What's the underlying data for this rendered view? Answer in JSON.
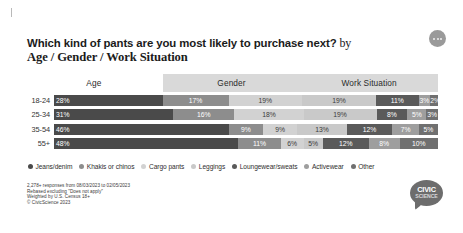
{
  "header": {
    "title_main": "Which kind of pants are you most likely to purchase next?",
    "title_by": " by",
    "title_sub": "Age / Gender / Work Situation",
    "menu_icon": "kebab-menu-icon"
  },
  "tabs": [
    {
      "label": "Age",
      "active": true
    },
    {
      "label": "Gender",
      "active": false
    },
    {
      "label": "Work Situation",
      "active": false
    }
  ],
  "footnote": {
    "line1": "2,278+ responses from 08/03/2023 to 02/05/2023",
    "line2": "Rebased excluding \"Does not apply\"",
    "line3": "Weighted by U.S. Census 18+",
    "line4": "© CivicScience 2023"
  },
  "logo": {
    "top": "CIVIC",
    "bottom": "SCIENCE"
  },
  "colors": {
    "jeans": "#4a4a4a",
    "khakis": "#8d8d8d",
    "cargo": "#d2d2d2",
    "leggings": "#c9c9c9",
    "loungewear": "#5a5a5a",
    "activewear": "#9e9e9e",
    "other": "#707070",
    "tab_active": "#ffffff",
    "tab_inactive": "#d9d9d9"
  },
  "chart_data": {
    "type": "bar",
    "orientation": "horizontal",
    "stacked": true,
    "title": "Which kind of pants are you most likely to purchase next? by Age / Gender / Work Situation",
    "xlabel": "",
    "ylabel": "",
    "categories": [
      "18-24",
      "25-34",
      "35-54",
      "55+"
    ],
    "legend_position": "bottom",
    "grid": false,
    "xlim": [
      0,
      100
    ],
    "series": [
      {
        "name": "Jeans/denim",
        "color": "#4a4a4a",
        "values": [
          28,
          31,
          46,
          48
        ]
      },
      {
        "name": "Khakis or chinos",
        "color": "#8d8d8d",
        "values": [
          17,
          16,
          9,
          11
        ]
      },
      {
        "name": "Cargo pants",
        "color": "#d2d2d2",
        "values": [
          19,
          18,
          9,
          6
        ]
      },
      {
        "name": "Leggings",
        "color": "#c9c9c9",
        "values": [
          19,
          19,
          13,
          5
        ]
      },
      {
        "name": "Loungewear/sweats",
        "color": "#5a5a5a",
        "values": [
          11,
          8,
          12,
          12
        ]
      },
      {
        "name": "Activewear",
        "color": "#9e9e9e",
        "values": [
          3,
          5,
          7,
          8
        ]
      },
      {
        "name": "Other",
        "color": "#707070",
        "values": [
          2,
          3,
          5,
          10
        ]
      }
    ]
  }
}
